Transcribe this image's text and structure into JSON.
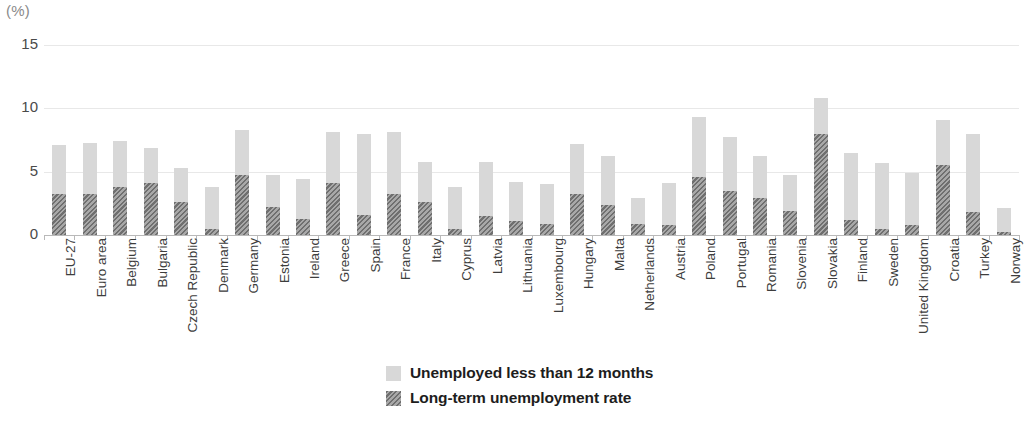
{
  "axis": {
    "unit_label": "(%)",
    "y_ticks": [
      "0",
      "5",
      "10",
      "15"
    ],
    "y_min": 0,
    "y_max": 15
  },
  "legend": {
    "position": "bottom-center",
    "items": [
      {
        "label": "Unemployed less than 12 months",
        "swatch": "light-gray-solid",
        "color": "#d8d8d8"
      },
      {
        "label": "Long-term unemployment rate",
        "swatch": "dark-gray-hatched",
        "color": "#6f6f6f"
      }
    ]
  },
  "chart_data": {
    "type": "bar",
    "stacked": true,
    "title": "",
    "subtitle": "",
    "xlabel": "",
    "ylabel": "(%)",
    "ylim": [
      0,
      15
    ],
    "yticks": [
      0,
      5,
      10,
      15
    ],
    "grid": true,
    "legend_position": "bottom-center",
    "categories": [
      "EU-27",
      "Euro area",
      "Belgium",
      "Bulgaria",
      "Czech Republic",
      "Denmark",
      "Germany",
      "Estonia",
      "Ireland",
      "Greece",
      "Spain",
      "France",
      "Italy",
      "Cyprus",
      "Latvia",
      "Lithuania",
      "Luxembourg",
      "Hungary",
      "Malta",
      "Netherlands",
      "Austria",
      "Poland",
      "Portugal",
      "Romania",
      "Slovenia",
      "Slovakia",
      "Finland",
      "Sweden",
      "United Kingdom",
      "Croatia",
      "Turkey",
      "Norway"
    ],
    "series": [
      {
        "name": "Long-term unemployment rate",
        "color": "#6f6f6f",
        "values": [
          3.2,
          3.2,
          3.8,
          4.1,
          2.6,
          0.5,
          4.7,
          2.2,
          1.3,
          4.1,
          1.6,
          3.2,
          2.6,
          0.5,
          1.5,
          1.1,
          0.9,
          3.2,
          2.4,
          0.9,
          0.8,
          4.6,
          3.5,
          2.9,
          1.9,
          8.0,
          1.2,
          0.5,
          0.8,
          5.5,
          1.8,
          0.2
        ]
      },
      {
        "name": "Unemployed less than 12 months",
        "color": "#d8d8d8",
        "values": [
          3.9,
          4.1,
          3.6,
          2.8,
          2.7,
          3.3,
          3.6,
          2.5,
          3.1,
          4.0,
          6.4,
          4.9,
          3.2,
          3.3,
          4.3,
          3.1,
          3.1,
          4.0,
          3.8,
          2.0,
          3.3,
          4.7,
          4.2,
          3.3,
          2.8,
          2.8,
          5.3,
          5.2,
          4.1,
          3.6,
          6.2,
          1.9
        ]
      }
    ],
    "totals": [
      7.1,
      7.3,
      7.4,
      6.9,
      5.3,
      3.8,
      8.3,
      4.7,
      4.4,
      8.1,
      8.0,
      8.1,
      5.8,
      3.8,
      5.8,
      4.2,
      4.0,
      7.2,
      6.2,
      2.9,
      4.1,
      9.3,
      7.7,
      6.2,
      4.7,
      10.8,
      6.5,
      5.7,
      4.9,
      9.1,
      8.0,
      2.1
    ]
  }
}
